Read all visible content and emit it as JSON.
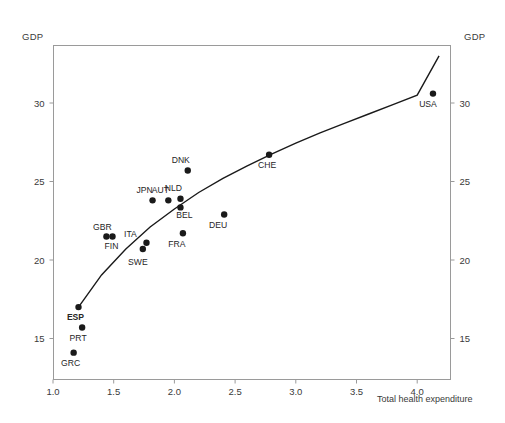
{
  "chart_data": {
    "type": "scatter",
    "title": "",
    "xlabel": "Total health expenditure",
    "ylabel": "GDP",
    "ylabel_right": "GDP",
    "xlim": [
      1.0,
      4.28
    ],
    "ylim": [
      13.2,
      33.6
    ],
    "xticks": [
      1.0,
      1.5,
      2.0,
      2.5,
      3.0,
      3.5,
      4.0
    ],
    "xticklabels": [
      "1.0",
      "1.5",
      "2.0",
      "2.5",
      "3.0",
      "3.5",
      "4.0"
    ],
    "yticks": [
      15,
      20,
      25,
      30
    ],
    "yticklabels": [
      "15",
      "20",
      "25",
      "30"
    ],
    "yticklabels_right": [
      "15",
      "20",
      "25",
      "30"
    ],
    "grid": false,
    "legend": "none",
    "points": [
      {
        "label": "GRC",
        "x": 1.17,
        "y": 14.1,
        "label_dx": -3,
        "label_dy": 13,
        "bold": false
      },
      {
        "label": "ESP",
        "x": 1.21,
        "y": 17.0,
        "label_dx": -3,
        "label_dy": 13,
        "bold": true
      },
      {
        "label": "PRT",
        "x": 1.24,
        "y": 15.7,
        "label_dx": -4,
        "label_dy": 13,
        "bold": false
      },
      {
        "label": "GBR",
        "x": 1.44,
        "y": 21.5,
        "label_dx": -4,
        "label_dy": -6,
        "bold": false
      },
      {
        "label": "FIN",
        "x": 1.49,
        "y": 21.5,
        "label_dx": -1,
        "label_dy": 13,
        "bold": false
      },
      {
        "label": "SWE",
        "x": 1.74,
        "y": 20.7,
        "label_dx": -5,
        "label_dy": 16,
        "bold": false
      },
      {
        "label": "ITA",
        "x": 1.77,
        "y": 21.1,
        "label_dx": -16,
        "label_dy": -6,
        "bold": false
      },
      {
        "label": "JPN",
        "x": 1.82,
        "y": 23.8,
        "label_dx": -8,
        "label_dy": -7,
        "bold": false
      },
      {
        "label": "AUT",
        "x": 1.95,
        "y": 23.8,
        "label_dx": -8,
        "label_dy": -7,
        "bold": false
      },
      {
        "label": "NLD",
        "x": 2.05,
        "y": 23.9,
        "label_dx": -7,
        "label_dy": -8,
        "bold": false
      },
      {
        "label": "BEL",
        "x": 2.05,
        "y": 23.35,
        "label_dx": 4,
        "label_dy": 11,
        "bold": false
      },
      {
        "label": "FRA",
        "x": 2.07,
        "y": 21.7,
        "label_dx": -6,
        "label_dy": 14,
        "bold": false
      },
      {
        "label": "DNK",
        "x": 2.11,
        "y": 25.7,
        "label_dx": -7,
        "label_dy": -8,
        "bold": false
      },
      {
        "label": "DEU",
        "x": 2.41,
        "y": 22.9,
        "label_dx": -6,
        "label_dy": 14,
        "bold": false
      },
      {
        "label": "CHE",
        "x": 2.78,
        "y": 26.7,
        "label_dx": -2,
        "label_dy": 13,
        "bold": false
      },
      {
        "label": "USA",
        "x": 4.13,
        "y": 30.6,
        "label_dx": -5,
        "label_dy": 13,
        "bold": false
      }
    ],
    "fit_curve": {
      "description": "concave fitted trend line",
      "points": [
        {
          "x": 1.21,
          "y": 17.0
        },
        {
          "x": 1.4,
          "y": 19.05
        },
        {
          "x": 1.6,
          "y": 20.7
        },
        {
          "x": 1.8,
          "y": 22.1
        },
        {
          "x": 2.0,
          "y": 23.25
        },
        {
          "x": 2.2,
          "y": 24.3
        },
        {
          "x": 2.4,
          "y": 25.2
        },
        {
          "x": 2.6,
          "y": 26.0
        },
        {
          "x": 2.8,
          "y": 26.75
        },
        {
          "x": 3.0,
          "y": 27.45
        },
        {
          "x": 3.2,
          "y": 28.1
        },
        {
          "x": 3.4,
          "y": 28.7
        },
        {
          "x": 3.6,
          "y": 29.3
        },
        {
          "x": 3.8,
          "y": 29.9
        },
        {
          "x": 4.0,
          "y": 30.5
        },
        {
          "x": 4.18,
          "y": 33.0
        }
      ]
    }
  },
  "labels": {
    "gdp_left": "GDP",
    "gdp_right": "GDP",
    "x_axis_title": "Total health expenditure"
  }
}
